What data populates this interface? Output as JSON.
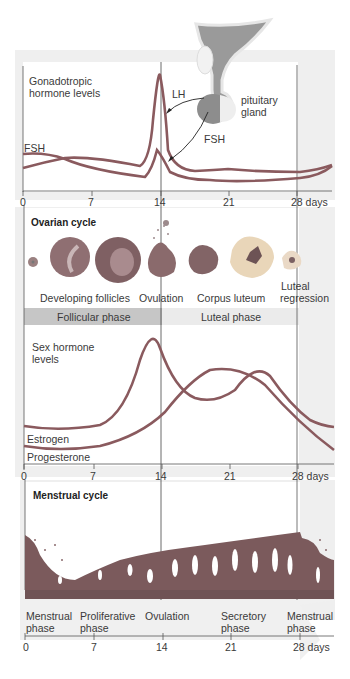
{
  "gonadotropic": {
    "title_line1": "Gonadotropic",
    "title_line2": "hormone levels",
    "lh_label": "LH",
    "fsh_label_left": "FSH",
    "fsh_label_arrow": "FSH",
    "gland_line1": "pituitary",
    "gland_line2": "gland"
  },
  "axis": {
    "ticks": [
      "0",
      "7",
      "14",
      "21",
      "28 days"
    ]
  },
  "ovarian": {
    "title": "Ovarian cycle",
    "stages": [
      "Developing follicles",
      "Ovulation",
      "Corpus luteum",
      "Luteal",
      "regression"
    ],
    "phases": [
      "Follicular phase",
      "Luteal phase"
    ]
  },
  "sex_hormone": {
    "title_line1": "Sex hormone",
    "title_line2": "levels",
    "estrogen": "Estrogen",
    "progesterone": "Progesterone"
  },
  "menstrual": {
    "title": "Menstrual cycle",
    "phases": [
      {
        "l1": "Menstrual",
        "l2": "phase"
      },
      {
        "l1": "Proliferative",
        "l2": "phase"
      },
      {
        "l1": "Ovulation",
        "l2": ""
      },
      {
        "l1": "Secretory",
        "l2": "phase"
      },
      {
        "l1": "Menstrual",
        "l2": "phase"
      }
    ]
  },
  "colors": {
    "curve": "#8a5a5e",
    "panel_bg": "#f1f1f1",
    "phase_bar": "#c4c4c4",
    "phase_bar_light": "#e8e8e8",
    "endometrium": "#7b5a5c"
  }
}
